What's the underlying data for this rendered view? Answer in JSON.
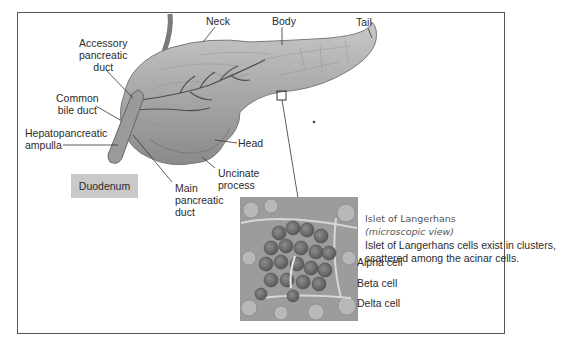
{
  "diagram": {
    "labels": {
      "neck": "Neck",
      "body": "Body",
      "tail": "Tail",
      "accessory_duct": [
        "Accessory",
        "pancreatic",
        "duct"
      ],
      "common_bile_duct": [
        "Common",
        "bile duct"
      ],
      "hepatopancreatic_ampulla": [
        "Hepatopancreatic",
        "ampulla"
      ],
      "head": "Head",
      "uncinate_process": [
        "Uncinate",
        "process"
      ],
      "main_duct": [
        "Main",
        "pancreatic",
        "duct"
      ],
      "duodenum": "Duodenum"
    },
    "islet": {
      "title": "Islet of Langerhans",
      "subtitle": "(microscopic view)",
      "description": [
        "Islet of Langerhans cells exist in clusters,",
        "scattered among the acinar cells."
      ],
      "cells": [
        "Alpha cell",
        "Beta cell",
        "Delta cell"
      ]
    },
    "colors": {
      "frame": "#555555",
      "duodenum_box": "#c9c9c9",
      "tissue": "#a9a9a9",
      "tissue_dark": "#6e6e6e"
    }
  }
}
